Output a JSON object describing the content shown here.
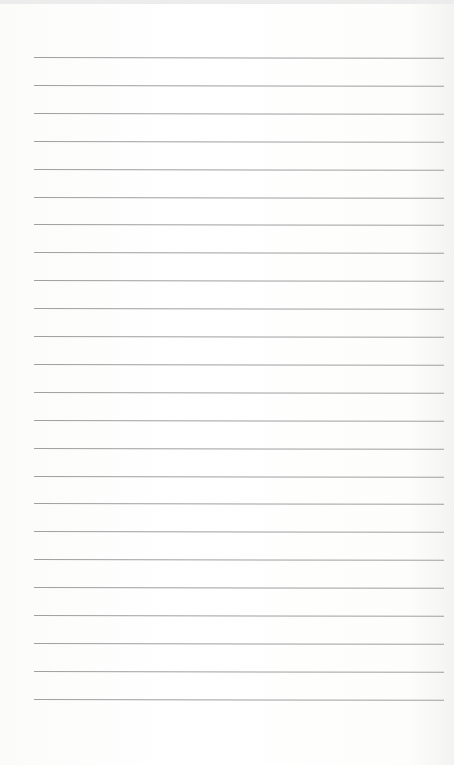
{
  "page": {
    "type": "blank lined paper",
    "background": "#fdfdfc",
    "rule_color": "#8f8f8f",
    "rule_left_px": 34,
    "rule_right_px": 444,
    "rule_count": 24,
    "first_rule_y_px": 57,
    "rule_spacing_px": 27.9
  }
}
